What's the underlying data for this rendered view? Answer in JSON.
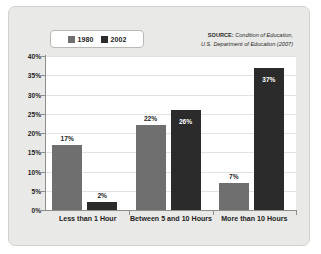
{
  "legend": {
    "items": [
      {
        "label": "1980",
        "color": "#6f6f6f"
      },
      {
        "label": "2002",
        "color": "#2b2b2b"
      }
    ]
  },
  "source": {
    "lead": "SOURCE:",
    "publication": " Condition of Education,",
    "line2": "U.S. Department of Education (2007)"
  },
  "chart_data": {
    "type": "bar",
    "title": "",
    "xlabel": "",
    "ylabel": "",
    "ylim": [
      0,
      40
    ],
    "grid": true,
    "legend_position": "top-left",
    "categories": [
      "Less than 1 Hour",
      "Between 5 and 10 Hours",
      "More than 10 Hours"
    ],
    "yticks": [
      "0%",
      "5%",
      "10%",
      "15%",
      "20%",
      "25%",
      "30%",
      "35%",
      "40%"
    ],
    "ytick_values": [
      0,
      5,
      10,
      15,
      20,
      25,
      30,
      35,
      40
    ],
    "series": [
      {
        "name": "1980",
        "color": "#6f6f6f",
        "values": [
          17,
          22,
          7
        ],
        "labels": [
          "17%",
          "22%",
          "7%"
        ],
        "label_placement": [
          "outside",
          "outside",
          "outside"
        ]
      },
      {
        "name": "2002",
        "color": "#2b2b2b",
        "values": [
          2,
          26,
          37
        ],
        "labels": [
          "2%",
          "26%",
          "37%"
        ],
        "label_placement": [
          "outside",
          "inside",
          "inside"
        ]
      }
    ]
  }
}
